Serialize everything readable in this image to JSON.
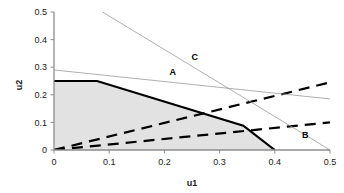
{
  "chart_data": {
    "type": "line",
    "title": "",
    "xlabel": "u1",
    "ylabel": "u2",
    "xlim": [
      0,
      0.5
    ],
    "ylim": [
      0,
      0.5
    ],
    "grid": false,
    "legend_position": "inline-annotations",
    "xticks": [
      "0",
      "0.1",
      "0.2",
      "0.3",
      "0.4",
      "0.5"
    ],
    "xtick_values": [
      0,
      0.1,
      0.2,
      0.3,
      0.4,
      0.5
    ],
    "yticks": [
      "0",
      "0.1",
      "0.2",
      "0.3",
      "0.4",
      "0.5"
    ],
    "ytick_values": [
      0,
      0.1,
      0.2,
      0.3,
      0.4,
      0.5
    ],
    "annotations": [
      {
        "text": "A",
        "x": 0.215,
        "y": 0.272
      },
      {
        "text": "B",
        "x": 0.455,
        "y": 0.043
      },
      {
        "text": "C",
        "x": 0.255,
        "y": 0.325
      }
    ],
    "shaded_region": {
      "name": "feasible-region",
      "color": "#e2e2e2",
      "vertices": [
        [
          0.0,
          0.0
        ],
        [
          0.0,
          0.25
        ],
        [
          0.078,
          0.25
        ],
        [
          0.343,
          0.088
        ],
        [
          0.4,
          0.0
        ]
      ]
    },
    "series": [
      {
        "name": "solid-boundary",
        "style": "solid",
        "color": "#000000",
        "width": 2.2,
        "points": [
          [
            0.0,
            0.25
          ],
          [
            0.078,
            0.25
          ],
          [
            0.343,
            0.088
          ],
          [
            0.4,
            0.0
          ]
        ]
      },
      {
        "name": "dashed-upper",
        "style": "dashed",
        "color": "#000000",
        "width": 2.2,
        "points": [
          [
            0.0,
            0.0
          ],
          [
            0.5,
            0.245
          ]
        ]
      },
      {
        "name": "dashed-lower",
        "style": "dashed",
        "color": "#000000",
        "width": 2.2,
        "points": [
          [
            0.0,
            0.0
          ],
          [
            0.5,
            0.1
          ]
        ]
      },
      {
        "name": "thin-line-A",
        "style": "solid",
        "color": "#9a9a9a",
        "width": 0.8,
        "points": [
          [
            0.0,
            0.29
          ],
          [
            0.5,
            0.185
          ]
        ]
      },
      {
        "name": "thin-line-C",
        "style": "solid",
        "color": "#9a9a9a",
        "width": 0.8,
        "points": [
          [
            0.088,
            0.5
          ],
          [
            0.5,
            0.0
          ]
        ]
      }
    ]
  }
}
